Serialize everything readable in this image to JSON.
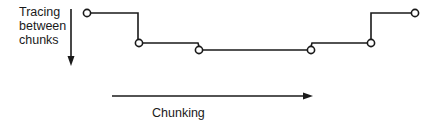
{
  "labels": {
    "vertical_axis": [
      "Tracing",
      "between",
      "chunks"
    ],
    "horizontal_axis": "Chunking"
  },
  "colors": {
    "line": "#1a1a1a",
    "node_fill": "#ffffff",
    "background": "#ffffff"
  },
  "path": {
    "nodes": [
      {
        "x": 87,
        "y": 13
      },
      {
        "x": 139,
        "y": 43
      },
      {
        "x": 199,
        "y": 50
      },
      {
        "x": 311,
        "y": 50
      },
      {
        "x": 371,
        "y": 43
      },
      {
        "x": 415,
        "y": 13
      }
    ]
  },
  "arrows": {
    "vertical": {
      "x": 71,
      "y1": 9,
      "y2": 65,
      "direction": "down"
    },
    "horizontal": {
      "y": 96,
      "x1": 112,
      "x2": 312,
      "direction": "right"
    }
  }
}
